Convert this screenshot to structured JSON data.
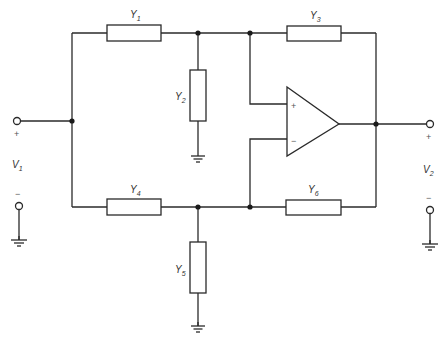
{
  "figure": {
    "type": "circuit-schematic"
  },
  "components": {
    "Y1": {
      "symbol": "Y",
      "subscript": "1"
    },
    "Y2": {
      "symbol": "Y",
      "subscript": "2"
    },
    "Y3": {
      "symbol": "Y",
      "subscript": "3"
    },
    "Y4": {
      "symbol": "Y",
      "subscript": "4"
    },
    "Y5": {
      "symbol": "Y",
      "subscript": "5"
    },
    "Y6": {
      "symbol": "Y",
      "subscript": "6"
    }
  },
  "opamp": {
    "noninverting_sign": "+",
    "inverting_sign": "−"
  },
  "ports": {
    "input": {
      "symbol": "V",
      "subscript": "1",
      "plus": "+",
      "minus": "−"
    },
    "output": {
      "symbol": "V",
      "subscript": "2",
      "plus": "+",
      "minus": "−"
    }
  }
}
